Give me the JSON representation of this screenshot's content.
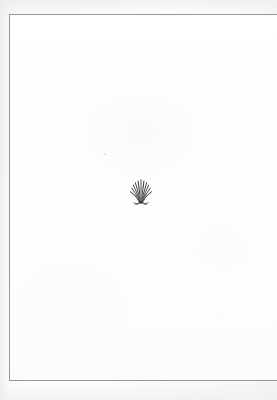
{
  "document": {
    "kind": "scanned-book-page",
    "page_state": "blank",
    "visible_text": "",
    "body_text_lines": []
  },
  "colors": {
    "scan_background": "#f7f7f8",
    "paper": "#ffffff",
    "page_rule": "#94949a",
    "ornament_ink": "#3a3a40"
  },
  "page": {
    "rule_top_y": 14,
    "rule_left_x": 9,
    "rule_bottom_y": 381,
    "right_edge_state": "bleeds off frame"
  },
  "ornament": {
    "name": "fan-shell-fleuron",
    "description": "printer's ornament, fan / scallop shell with radiating petals and curled base tendrils",
    "center_x": 141,
    "center_y": 191,
    "width": 26,
    "height": 27,
    "ink_color": "#3a3a40",
    "petal_count": 11
  },
  "specks": [
    {
      "x": 104,
      "y": 153,
      "size": 1.6
    },
    {
      "x": 38,
      "y": 243,
      "size": 1.2
    },
    {
      "x": 193,
      "y": 96,
      "size": 1.4
    },
    {
      "x": 67,
      "y": 292,
      "size": 1.1
    },
    {
      "x": 221,
      "y": 317,
      "size": 1.3
    },
    {
      "x": 150,
      "y": 62,
      "size": 1.0
    },
    {
      "x": 88,
      "y": 348,
      "size": 1.2
    }
  ]
}
